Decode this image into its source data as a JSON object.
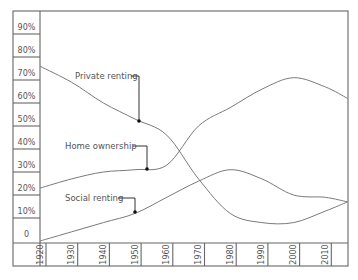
{
  "chart_data": {
    "type": "line",
    "title": "",
    "xlabel": "",
    "ylabel": "",
    "x": [
      1920,
      1930,
      1940,
      1950,
      1960,
      1970,
      1980,
      1990,
      2000,
      2010,
      2017
    ],
    "series": [
      {
        "name": "Private renting",
        "values": [
          76,
          69,
          60,
          53,
          46,
          27,
          12,
          8,
          8,
          13,
          17
        ],
        "marker": {
          "x": 1951,
          "y": 52
        }
      },
      {
        "name": "Home ownership",
        "values": [
          23,
          27,
          30,
          31,
          33,
          50,
          58,
          66,
          71,
          67,
          62
        ],
        "marker": {
          "x": 1954,
          "y": 31
        }
      },
      {
        "name": "Social renting",
        "values": [
          0,
          4,
          8,
          12,
          19,
          26,
          31,
          27,
          20,
          19,
          17
        ],
        "marker": {
          "x": 1950,
          "y": 12.5
        }
      }
    ],
    "y_tick_labels": [
      "0",
      "10%",
      "20%",
      "30%",
      "40%",
      "50%",
      "60%",
      "70%",
      "80%",
      "90%"
    ],
    "x_tick_labels": [
      "1920",
      "1930",
      "1940",
      "1950",
      "1960",
      "1970",
      "1980",
      "1990",
      "2000",
      "2010"
    ],
    "ylim": [
      0,
      100
    ],
    "xlim": [
      1920,
      2017
    ],
    "grid": false,
    "legend": "inline callouts"
  },
  "callouts": [
    {
      "label": "Private renting",
      "text_x": 75,
      "text_y": 79,
      "path": "M131,76 L139,76 L139,121",
      "dot_x": 139,
      "dot_y": 121
    },
    {
      "label": "Home ownership",
      "text_x": 65,
      "text_y": 149,
      "path": "M133,146 L147,146 L147,169",
      "dot_x": 147,
      "dot_y": 169
    },
    {
      "label": "Social renting",
      "text_x": 65,
      "text_y": 201,
      "path": "M118,198 L135,198 L135,212",
      "dot_x": 135,
      "dot_y": 212
    }
  ]
}
